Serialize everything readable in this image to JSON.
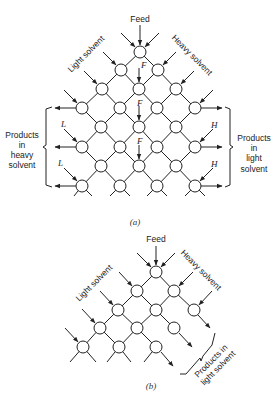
{
  "figure_a": {
    "caption": "(a)",
    "labels": {
      "feed": "Feed",
      "light_solvent": "Light solvent",
      "heavy_solvent": "Heavy solvent",
      "products_heavy": [
        "Products",
        "in",
        "heavy",
        "solvent"
      ],
      "products_light": [
        "Products",
        "in",
        "light",
        "solvent"
      ],
      "F": "F",
      "L": "L",
      "H": "H"
    },
    "nodes": [
      [
        140,
        52
      ],
      [
        121,
        70
      ],
      [
        158,
        70
      ],
      [
        102,
        89
      ],
      [
        139,
        89
      ],
      [
        176,
        89
      ],
      [
        82,
        108
      ],
      [
        120,
        108
      ],
      [
        157,
        108
      ],
      [
        195,
        108
      ],
      [
        101,
        127
      ],
      [
        139,
        127
      ],
      [
        176,
        127
      ],
      [
        82,
        147
      ],
      [
        120,
        147
      ],
      [
        157,
        147
      ],
      [
        195,
        147
      ],
      [
        101,
        166
      ],
      [
        139,
        166
      ],
      [
        176,
        166
      ],
      [
        82,
        186
      ],
      [
        120,
        186
      ],
      [
        157,
        186
      ],
      [
        195,
        186
      ]
    ]
  },
  "figure_b": {
    "caption": "(b)",
    "labels": {
      "feed": "Feed",
      "light_solvent": "Light solvent",
      "heavy_solvent": "Heavy solvent",
      "products_light": [
        "Products in",
        "light solvent"
      ]
    },
    "nodes": [
      [
        156,
        272
      ],
      [
        137,
        291
      ],
      [
        174,
        291
      ],
      [
        118,
        310
      ],
      [
        156,
        310
      ],
      [
        194,
        310
      ],
      [
        100,
        328
      ],
      [
        137,
        328
      ],
      [
        174,
        328
      ],
      [
        83,
        347
      ],
      [
        119,
        347
      ],
      [
        156,
        347
      ]
    ]
  }
}
